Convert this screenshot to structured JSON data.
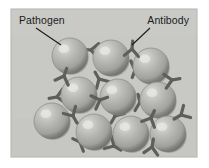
{
  "figure": {
    "name": "antibody-pathogen-agglutination",
    "panel": {
      "x": 11,
      "y": 9,
      "width": 186,
      "height": 148,
      "background_color": "#c8c9c5",
      "border_color": "#b0b1ad"
    },
    "page_background_color": "#ffffff"
  },
  "labels": [
    {
      "id": "pathogen",
      "text": "Pathogen",
      "text_x": 19,
      "text_y": 24,
      "anchor": "start",
      "color": "#1a1a1a",
      "leader_line": {
        "x1": 36,
        "y1": 28,
        "x2": 61,
        "y2": 45
      }
    },
    {
      "id": "antibody",
      "text": "Antibody",
      "text_x": 189,
      "text_y": 24,
      "anchor": "end",
      "color": "#1a1a1a",
      "leader_line": {
        "x1": 150,
        "y1": 28,
        "x2": 132,
        "y2": 45
      }
    }
  ],
  "pathogens": {
    "fill_color": "#a8a9a6",
    "highlight_color": "#d6d7d3",
    "shadow_color": "#7d7e7b",
    "edge_color": "#8f908c",
    "radius": 18,
    "spheres": [
      {
        "id": "pathogen-1",
        "cx": 70,
        "cy": 56,
        "r": 18
      },
      {
        "id": "pathogen-2",
        "cx": 111,
        "cy": 58,
        "r": 18
      },
      {
        "id": "pathogen-3",
        "cx": 151,
        "cy": 66,
        "r": 18
      },
      {
        "id": "pathogen-4",
        "cx": 79,
        "cy": 95,
        "r": 18
      },
      {
        "id": "pathogen-5",
        "cx": 118,
        "cy": 97,
        "r": 18
      },
      {
        "id": "pathogen-6",
        "cx": 158,
        "cy": 100,
        "r": 18
      },
      {
        "id": "pathogen-7",
        "cx": 52,
        "cy": 121,
        "r": 18
      },
      {
        "id": "pathogen-8",
        "cx": 94,
        "cy": 132,
        "r": 18
      },
      {
        "id": "pathogen-9",
        "cx": 131,
        "cy": 134,
        "r": 18
      },
      {
        "id": "pathogen-10",
        "cx": 168,
        "cy": 134,
        "r": 18
      }
    ]
  },
  "antibodies": {
    "color": "#5e5f5c",
    "stroke_width": 3.2,
    "arm_length": 7,
    "stem_length": 8,
    "items": [
      {
        "id": "antibody-1",
        "x": 91,
        "y": 50,
        "rotation": 95
      },
      {
        "id": "antibody-2",
        "x": 132,
        "y": 49,
        "rotation": 185
      },
      {
        "id": "antibody-3",
        "x": 135,
        "y": 70,
        "rotation": 20
      },
      {
        "id": "antibody-4",
        "x": 64,
        "y": 76,
        "rotation": 200
      },
      {
        "id": "antibody-5",
        "x": 99,
        "y": 79,
        "rotation": 150
      },
      {
        "id": "antibody-6",
        "x": 172,
        "y": 80,
        "rotation": 260
      },
      {
        "id": "antibody-7",
        "x": 57,
        "y": 97,
        "rotation": 80
      },
      {
        "id": "antibody-8",
        "x": 100,
        "y": 100,
        "rotation": 250
      },
      {
        "id": "antibody-9",
        "x": 140,
        "y": 102,
        "rotation": 165
      },
      {
        "id": "antibody-10",
        "x": 73,
        "y": 116,
        "rotation": 330
      },
      {
        "id": "antibody-11",
        "x": 115,
        "y": 116,
        "rotation": 30
      },
      {
        "id": "antibody-12",
        "x": 151,
        "y": 118,
        "rotation": 205
      },
      {
        "id": "antibody-13",
        "x": 80,
        "y": 142,
        "rotation": 115
      },
      {
        "id": "antibody-14",
        "x": 152,
        "y": 147,
        "rotation": 190
      },
      {
        "id": "antibody-15",
        "x": 114,
        "y": 146,
        "rotation": 300
      },
      {
        "id": "antibody-16",
        "x": 181,
        "y": 115,
        "rotation": 60
      }
    ]
  }
}
